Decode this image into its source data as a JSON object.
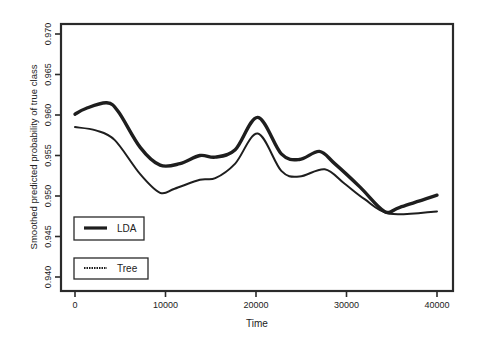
{
  "chart_data": {
    "type": "line",
    "title": "",
    "xlabel": "Time",
    "ylabel": "Smoothed predicted probability of true class",
    "xlim": [
      0,
      40000
    ],
    "ylim": [
      0.94,
      0.97
    ],
    "grid": false,
    "legend_position": "lower-left (inside plot, two separate boxes)",
    "x_ticks": [
      0,
      10000,
      20000,
      30000,
      40000
    ],
    "x_tick_labels": [
      "0",
      "10000",
      "20000",
      "30000",
      "40000"
    ],
    "y_ticks": [
      0.94,
      0.945,
      0.95,
      0.955,
      0.96,
      0.965,
      0.97
    ],
    "y_tick_labels": [
      "0.940",
      "0.945",
      "0.950",
      "0.955",
      "0.960",
      "0.965",
      "0.970"
    ],
    "series": [
      {
        "name": "LDA",
        "style": "thick solid",
        "x": [
          0,
          1200,
          3500,
          4800,
          7200,
          9400,
          11600,
          13800,
          15500,
          17700,
          20200,
          22800,
          24800,
          27000,
          28700,
          31500,
          34200,
          35900,
          40000
        ],
        "y": [
          0.9601,
          0.9608,
          0.9615,
          0.9604,
          0.956,
          0.9538,
          0.954,
          0.955,
          0.9548,
          0.9557,
          0.9597,
          0.9552,
          0.9545,
          0.9555,
          0.954,
          0.9511,
          0.9481,
          0.9486,
          0.9501
        ]
      },
      {
        "name": "Tree",
        "style": "thin solid",
        "x": [
          0,
          2300,
          4400,
          7200,
          9400,
          11000,
          13800,
          15500,
          17700,
          20200,
          22800,
          24800,
          27600,
          29800,
          32000,
          34800,
          40000
        ],
        "y": [
          0.9585,
          0.9581,
          0.9569,
          0.9527,
          0.9504,
          0.9509,
          0.952,
          0.9522,
          0.954,
          0.9577,
          0.9531,
          0.9524,
          0.9533,
          0.9515,
          0.9496,
          0.9478,
          0.9481
        ]
      }
    ]
  },
  "legend": {
    "items": [
      {
        "label": "LDA"
      },
      {
        "label": "Tree"
      }
    ]
  },
  "axes": {
    "xlabel": "Time",
    "ylabel": "Smoothed predicted probability of true class"
  },
  "colors": {
    "line": "#1e1e1e",
    "frame": "#2a2a2a",
    "background": "#ffffff"
  }
}
